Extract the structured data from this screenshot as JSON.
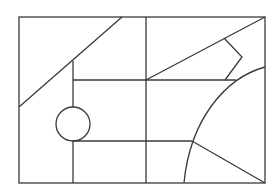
{
  "diagram": {
    "type": "geometric-line-drawing",
    "stroke_color": "#3a3a3a",
    "background": "#ffffff",
    "frame": {
      "x": 19,
      "y": 17,
      "width": 246,
      "height": 166
    },
    "shapes": {
      "diagonal_left": {
        "x1": 122,
        "y1": 17,
        "x2": 19,
        "y2": 107
      },
      "vertical_left": {
        "x1": 73,
        "y1": 61,
        "x2": 73,
        "y2": 107
      },
      "vertical_left_lower": {
        "x1": 73,
        "y1": 141,
        "x2": 73,
        "y2": 183
      },
      "vertical_center": {
        "x1": 146,
        "y1": 17,
        "x2": 146,
        "y2": 183
      },
      "horizontal_upper": {
        "x1": 73,
        "y1": 80,
        "x2": 236,
        "y2": 80
      },
      "horizontal_lower": {
        "x1": 73,
        "y1": 141,
        "x2": 192,
        "y2": 141
      },
      "diagonal_right_upper": {
        "x1": 146,
        "y1": 80,
        "x2": 265,
        "y2": 17
      },
      "zigzag": {
        "points": "224,38 242,57 225,80"
      },
      "diagonal_right_lower": {
        "x1": 192,
        "y1": 141,
        "x2": 265,
        "y2": 183
      },
      "arc": {
        "d": "M 265 67 C 225 78, 190 120, 184 183"
      },
      "circle": {
        "cx": 73,
        "cy": 124,
        "r": 17
      }
    }
  }
}
